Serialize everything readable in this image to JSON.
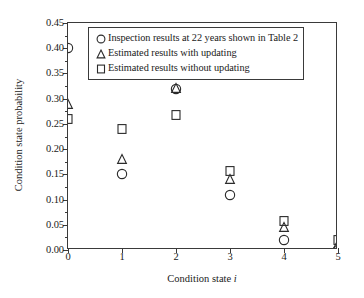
{
  "chart_data": {
    "type": "scatter",
    "title": "",
    "xlabel": "Condition state i",
    "ylabel": "Condition state probability",
    "xlim": [
      0,
      5
    ],
    "ylim": [
      0.0,
      0.45
    ],
    "xticks": [
      "0",
      "1",
      "2",
      "3",
      "4",
      "5"
    ],
    "yticks": [
      "0.00",
      "0.05",
      "0.10",
      "0.15",
      "0.20",
      "0.25",
      "0.30",
      "0.35",
      "0.40",
      "0.45"
    ],
    "ytick_values": [
      0.0,
      0.05,
      0.1,
      0.15,
      0.2,
      0.25,
      0.3,
      0.35,
      0.4,
      0.45
    ],
    "grid": false,
    "legend_position": "upper-right-inside",
    "x": [
      0,
      1,
      2,
      3,
      4,
      5
    ],
    "series": [
      {
        "name": "Inspection results at 22 years shown in Table 2",
        "marker": "circle",
        "values": [
          0.4,
          0.15,
          0.32,
          0.11,
          0.02,
          0.0
        ]
      },
      {
        "name": "Estimated results with updating",
        "marker": "triangle",
        "values": [
          0.29,
          0.18,
          0.322,
          0.14,
          0.045,
          0.012
        ]
      },
      {
        "name": "Estimated results without updating",
        "marker": "square",
        "values": [
          0.26,
          0.24,
          0.268,
          0.156,
          0.057,
          0.02
        ]
      }
    ]
  },
  "legend": {
    "entries": [
      {
        "marker": "circle-icon",
        "label": "Inspection results at 22 years shown in Table 2"
      },
      {
        "marker": "triangle-icon",
        "label": "Estimated results with updating"
      },
      {
        "marker": "square-icon",
        "label": "Estimated results without updating"
      }
    ]
  },
  "axis_titles": {
    "y": "Condition state probability",
    "x_prefix": "Condition state ",
    "x_italic": "i"
  },
  "colors": {
    "marker_stroke": "#2b2b2b",
    "axis": "#3a3a3a",
    "background": "#ffffff"
  }
}
